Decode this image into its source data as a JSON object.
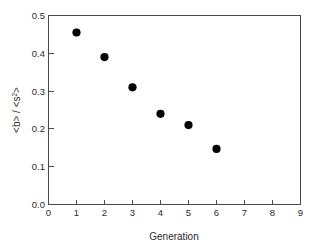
{
  "chart_data": {
    "type": "scatter",
    "title": "",
    "xlabel": "Generation",
    "ylabel": "<b> / <s2>",
    "ylabel_parts": {
      "main": "<b> / <s",
      "sup": "2",
      "tail": ">"
    },
    "x": [
      1,
      2,
      3,
      4,
      5,
      6
    ],
    "values": [
      0.455,
      0.39,
      0.31,
      0.24,
      0.21,
      0.147
    ],
    "series": [
      {
        "name": "",
        "marker": "filled-circle",
        "color": "#000000",
        "points": [
          {
            "x": 1,
            "y": 0.455
          },
          {
            "x": 2,
            "y": 0.39
          },
          {
            "x": 3,
            "y": 0.31
          },
          {
            "x": 4,
            "y": 0.24
          },
          {
            "x": 5,
            "y": 0.21
          },
          {
            "x": 6,
            "y": 0.147
          }
        ]
      }
    ],
    "xlim": [
      0,
      9
    ],
    "ylim": [
      0.0,
      0.5
    ],
    "xticks": [
      0,
      1,
      2,
      3,
      4,
      5,
      6,
      7,
      8,
      9
    ],
    "yticks": [
      0.0,
      0.1,
      0.2,
      0.3,
      0.4,
      0.5
    ],
    "xtick_labels": [
      "0",
      "1",
      "2",
      "3",
      "4",
      "5",
      "6",
      "7",
      "8",
      "9"
    ],
    "ytick_labels": [
      "0.0",
      "0.1",
      "0.2",
      "0.3",
      "0.4",
      "0.5"
    ],
    "grid": false,
    "legend": false,
    "legend_position": "none",
    "frame_color": "#4a4a4a",
    "background": "#ffffff"
  },
  "axes": {
    "x_title": "Generation",
    "y_title_main": "<b> / <s",
    "y_title_sup": "2",
    "y_title_tail": ">"
  }
}
